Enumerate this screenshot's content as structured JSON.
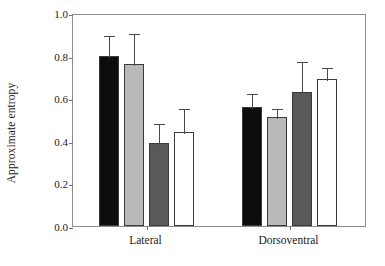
{
  "chart_data": {
    "type": "bar",
    "title": "",
    "xlabel": "",
    "ylabel": "Approximate entropy",
    "ylim": [
      0.0,
      1.0
    ],
    "yticks": [
      0.0,
      0.2,
      0.4,
      0.6,
      0.8,
      1.0
    ],
    "ytick_labels": [
      "0.0",
      "0.2",
      "0.4",
      "0.6",
      "0.8",
      "1.0"
    ],
    "grid": false,
    "legend": "none",
    "categories": [
      "Lateral",
      "Dorsoventral"
    ],
    "series": [
      {
        "name": "Condition 1",
        "color": "#0d0d0d",
        "values": [
          0.8,
          0.56
        ],
        "errors_upper": [
          0.1,
          0.07
        ]
      },
      {
        "name": "Condition 2",
        "color": "#b9b9b9",
        "values": [
          0.76,
          0.51
        ],
        "errors_upper": [
          0.15,
          0.05
        ]
      },
      {
        "name": "Condition 3",
        "color": "#595959",
        "values": [
          0.39,
          0.63
        ],
        "errors_upper": [
          0.1,
          0.15
        ]
      },
      {
        "name": "Condition 4",
        "color": "#ffffff",
        "values": [
          0.44,
          0.69
        ],
        "errors_upper": [
          0.12,
          0.06
        ]
      }
    ],
    "bars": [
      {
        "group": "Lateral",
        "series": "Condition 1",
        "color": "#0d0d0d",
        "value": 0.8,
        "error_top": 0.9
      },
      {
        "group": "Lateral",
        "series": "Condition 2",
        "color": "#b9b9b9",
        "value": 0.76,
        "error_top": 0.91
      },
      {
        "group": "Lateral",
        "series": "Condition 3",
        "color": "#595959",
        "value": 0.39,
        "error_top": 0.49
      },
      {
        "group": "Lateral",
        "series": "Condition 4",
        "color": "#ffffff",
        "value": 0.44,
        "error_top": 0.56
      },
      {
        "group": "Dorsoventral",
        "series": "Condition 1",
        "color": "#0d0d0d",
        "value": 0.56,
        "error_top": 0.63
      },
      {
        "group": "Dorsoventral",
        "series": "Condition 2",
        "color": "#b9b9b9",
        "value": 0.51,
        "error_top": 0.56
      },
      {
        "group": "Dorsoventral",
        "series": "Condition 3",
        "color": "#595959",
        "value": 0.63,
        "error_top": 0.78
      },
      {
        "group": "Dorsoventral",
        "series": "Condition 4",
        "color": "#ffffff",
        "value": 0.69,
        "error_top": 0.75
      }
    ]
  },
  "axis": {
    "y_title": "Approximate entropy",
    "y_tick_labels": [
      "1.0",
      "0.8",
      "0.6",
      "0.4",
      "0.2",
      "0.0"
    ],
    "x_group_labels": [
      "Lateral",
      "Dorsoventral"
    ]
  }
}
